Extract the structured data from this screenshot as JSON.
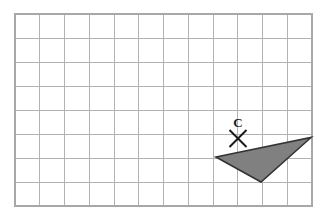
{
  "figure": {
    "canvas": {
      "width": 326,
      "height": 217,
      "background": "#ffffff"
    },
    "grid": {
      "columns": 12,
      "rows": 8,
      "x0": 15,
      "y0": 14,
      "cell_width": 24.75,
      "cell_height": 24,
      "line_color": "#b2b2b2",
      "border_color": "#a8a8a8",
      "line_width": 1
    },
    "shapes": [
      {
        "name": "shaded-triangle",
        "type": "polygon",
        "points": "216,157 311,137.5 261,182",
        "fill": "#808080",
        "stroke": "#333333",
        "stroke_width": 1.6
      }
    ],
    "marks": [
      {
        "name": "center-of-rotation",
        "type": "cross",
        "label": "C",
        "x": 238,
        "y": 138.5,
        "arm": 8.5,
        "stroke": "#1a1a1a",
        "stroke_width": 1.9,
        "label_x": 238,
        "label_y": 127,
        "label_size": 13,
        "label_color": "#1a1a1a"
      }
    ]
  }
}
